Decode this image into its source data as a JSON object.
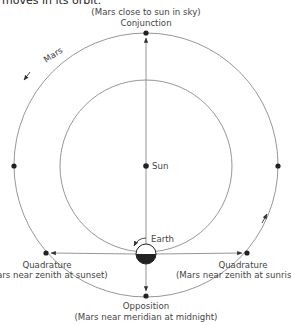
{
  "caption": "moves in its orbit.",
  "labels": {
    "conjunction_note": "(Mars close to sun in sky)",
    "conjunction": "Conjunction",
    "mars": "Mars",
    "sun": "Sun",
    "earth": "Earth",
    "quadrature_left": "Quadrature",
    "quadrature_left_note": "(Mars near zenith at sunset)",
    "quadrature_right": "Quadrature",
    "quadrature_right_note": "(Mars near zenith at sunrise)",
    "opposition": "Opposition",
    "opposition_note": "(Mars near meridian at midnight)"
  },
  "colors": {
    "line": "#8a8a8a",
    "dot": "#222222",
    "text": "#444444"
  }
}
